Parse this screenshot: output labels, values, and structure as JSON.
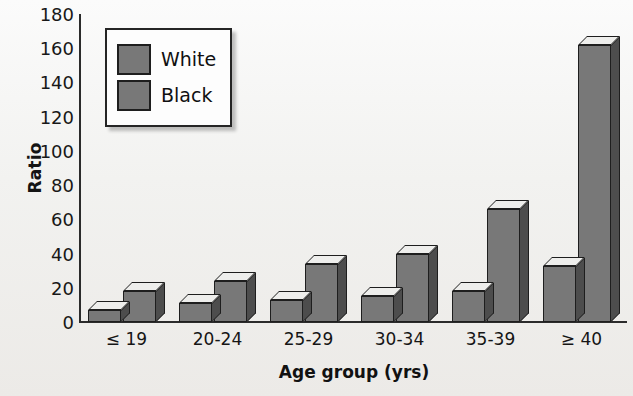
{
  "chart_data": {
    "type": "bar",
    "title": "",
    "subtitle": "",
    "xlabel": "Age group (yrs)",
    "ylabel": "Ratio",
    "categories": [
      "≤ 19",
      "20-24",
      "25-29",
      "30-34",
      "35-39",
      "≥ 40"
    ],
    "series": [
      {
        "name": "White",
        "values": [
          7,
          11,
          13,
          15,
          18,
          33
        ],
        "color": "#787878"
      },
      {
        "name": "Black",
        "values": [
          18,
          24,
          34,
          40,
          66,
          162
        ],
        "color": "#787878"
      }
    ],
    "ylim": [
      0,
      180
    ],
    "ytick_step": 20,
    "ytick_labels": [
      "180",
      "160",
      "140",
      "120",
      "100",
      "80",
      "60",
      "40",
      "20",
      "0"
    ],
    "grid": false,
    "legend_position": "top-left",
    "style": "3d-bars",
    "colors": {
      "bar_front": "#787878",
      "bar_side": "#4d4d4d",
      "bar_top": "#eeeeec",
      "bar_edge": "#1e1e1e",
      "axis": "#2b2b2b",
      "text": "#141414",
      "background": "#f1efec",
      "legend_background": "#fdfdfd"
    }
  },
  "legend": {
    "entries": [
      {
        "label": "White",
        "swatch": "legend-swatch-white"
      },
      {
        "label": "Black",
        "swatch": "legend-swatch-black"
      }
    ]
  }
}
